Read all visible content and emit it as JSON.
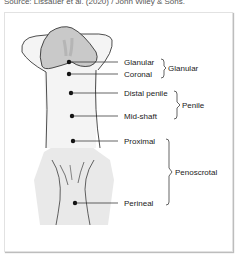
{
  "source": "Source: Lissauer et al. (2020) / John Wiley & Sons.",
  "labels": {
    "glanular": "Glanular",
    "coronal": "Coronal",
    "distal_penile": "Distal penile",
    "mid_shaft": "Mid-shaft",
    "proximal": "Proximal",
    "perineal": "Perineal"
  },
  "groups": {
    "glanular": "Glanular",
    "penile": "Penile",
    "penoscrotal": "Penoscrotal"
  },
  "colors": {
    "glans": "#c9c9c9",
    "shaft": "#f3f3f3",
    "scrotum": "#e9e9e9",
    "line": "#222222"
  }
}
